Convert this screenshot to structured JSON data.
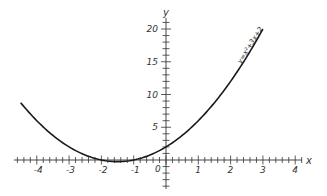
{
  "chart_data": {
    "type": "line",
    "title": "",
    "xlabel": "x",
    "ylabel": "y",
    "xlim": [
      -4.6,
      4.2
    ],
    "ylim": [
      -3.5,
      21
    ],
    "grid": false,
    "x_ticks": [
      -4,
      -3,
      -2,
      -1,
      1,
      2,
      3,
      4
    ],
    "y_ticks": [
      5,
      10,
      15,
      20
    ],
    "origin_label": "0",
    "series": [
      {
        "name": "y=x²+3x+2",
        "x": [
          -4.5,
          -4,
          -3.5,
          -3,
          -2.5,
          -2,
          -1.5,
          -1,
          -0.5,
          0,
          0.5,
          1,
          1.5,
          2,
          2.5,
          3
        ],
        "values": [
          8.75,
          6,
          3.75,
          2,
          0.75,
          0,
          -0.25,
          0,
          0.75,
          2,
          3.75,
          6,
          8.75,
          12,
          15.75,
          20
        ]
      }
    ],
    "annotations": [
      {
        "text": "y=x²+3x+2",
        "position": "along curve near x=2.5"
      }
    ]
  }
}
